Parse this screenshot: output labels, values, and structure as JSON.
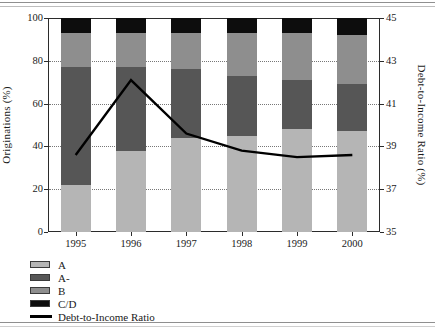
{
  "chart_data": {
    "type": "bar",
    "title": "",
    "subtitle": "",
    "xlabel": "",
    "ylabel": "Originations (%)",
    "y2label": "Debt-to-Income Ratio (%)",
    "categories": [
      "1995",
      "1996",
      "1997",
      "1998",
      "1999",
      "2000"
    ],
    "ylim": [
      0,
      100
    ],
    "y2lim": [
      35,
      45
    ],
    "yticks": [
      "0",
      "20",
      "40",
      "60",
      "80",
      "100"
    ],
    "y2ticks": [
      "35",
      "37",
      "39",
      "41",
      "43",
      "45"
    ],
    "grid": true,
    "grid_style": "dotted-horizontal",
    "stacked": true,
    "legend_position": "below-left",
    "series": [
      {
        "name": "A",
        "type": "bar",
        "axis": "left",
        "color": "#b5b5b5",
        "values": [
          22,
          38,
          44,
          45,
          48,
          47
        ]
      },
      {
        "name": "A-",
        "type": "bar",
        "axis": "left",
        "color": "#565656",
        "values": [
          55,
          39,
          32,
          28,
          23,
          22
        ]
      },
      {
        "name": "B",
        "type": "bar",
        "axis": "left",
        "color": "#8e8e8e",
        "values": [
          16,
          16,
          17,
          20,
          22,
          23
        ]
      },
      {
        "name": "C/D",
        "type": "bar",
        "axis": "left",
        "color": "#0d0d0d",
        "values": [
          7,
          7,
          7,
          7,
          7,
          8
        ]
      },
      {
        "name": "Debt-to-Income Ratio",
        "type": "line",
        "axis": "right",
        "color": "#000000",
        "values": [
          38.6,
          42.1,
          39.6,
          38.8,
          38.5,
          38.6
        ]
      }
    ]
  },
  "legend": {
    "items": [
      {
        "label": "A"
      },
      {
        "label": "A-"
      },
      {
        "label": "B"
      },
      {
        "label": "C/D"
      },
      {
        "label": "Debt-to-Income Ratio"
      }
    ]
  }
}
